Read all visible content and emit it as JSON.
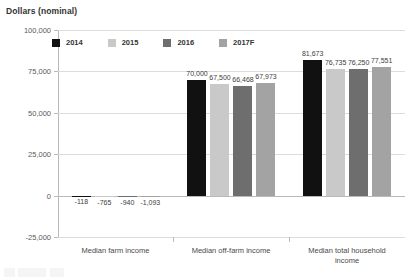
{
  "chart_data": {
    "type": "bar",
    "title": "Dollars (nominal)",
    "xlabel": "",
    "ylabel": "Dollars (nominal)",
    "ylim": [
      -25000,
      100000
    ],
    "ytick_labels": [
      "100,000",
      "75,000",
      "50,000",
      "25,000",
      "0",
      "-25,000"
    ],
    "ytick_values": [
      100000,
      75000,
      50000,
      25000,
      0,
      -25000
    ],
    "grid": true,
    "legend_position": "top-left",
    "categories": [
      "Median farm income",
      "Median off-farm income",
      "Median total household income"
    ],
    "series": [
      {
        "name": "2014",
        "color": "#111111",
        "values": [
          -118,
          70000,
          81673
        ],
        "labels": [
          "-118",
          "70,000",
          "81,673"
        ]
      },
      {
        "name": "2015",
        "color": "#c9c9c9",
        "values": [
          -765,
          67500,
          76735
        ],
        "labels": [
          "-765",
          "67,500",
          "76,735"
        ]
      },
      {
        "name": "2016",
        "color": "#6e6e6e",
        "values": [
          -940,
          66468,
          76250
        ],
        "labels": [
          "-940",
          "66,468",
          "76,250"
        ]
      },
      {
        "name": "2017F",
        "color": "#a3a3a3",
        "values": [
          -1093,
          67973,
          77551
        ],
        "labels": [
          "-1,093",
          "67,973",
          "77,551"
        ]
      }
    ]
  },
  "legend": {
    "items": [
      {
        "label": "2014"
      },
      {
        "label": "2015"
      },
      {
        "label": "2016"
      },
      {
        "label": "2017F"
      }
    ]
  },
  "axis": {
    "title": "Dollars (nominal)",
    "y_labels": [
      "100,000",
      "75,000",
      "50,000",
      "25,000",
      "0",
      "-25,000"
    ],
    "x_labels": [
      {
        "line1": "Median farm income",
        "line2": ""
      },
      {
        "line1": "Median off-farm income",
        "line2": ""
      },
      {
        "line1": "Median total household",
        "line2": "income"
      }
    ]
  }
}
